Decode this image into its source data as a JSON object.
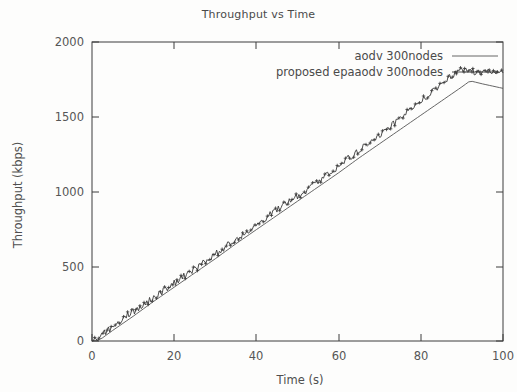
{
  "chart_data": {
    "type": "line",
    "title": "Throughput vs Time",
    "xlabel": "Time (s)",
    "ylabel": "Throughput (kbps)",
    "xlim": [
      0,
      100
    ],
    "ylim": [
      0,
      2000
    ],
    "xticks": [
      "0",
      "20",
      "40",
      "60",
      "80",
      "100"
    ],
    "xtick_values": [
      0,
      20,
      40,
      60,
      80,
      100
    ],
    "yticks": [
      "0",
      "500",
      "1000",
      "1500",
      "2000"
    ],
    "ytick_values": [
      0,
      500,
      1000,
      1500,
      2000
    ],
    "grid": false,
    "legend_position": "top-right-inside",
    "series": [
      {
        "name": "aodv 300nodes",
        "marker": "none",
        "color": "#555555",
        "x": [
          0,
          2,
          5,
          10,
          15,
          20,
          25,
          30,
          35,
          40,
          45,
          50,
          55,
          60,
          65,
          70,
          75,
          80,
          85,
          90,
          92,
          95,
          100
        ],
        "values": [
          0,
          10,
          70,
          165,
          265,
          360,
          455,
          550,
          650,
          745,
          840,
          935,
          1030,
          1125,
          1225,
          1320,
          1415,
          1510,
          1605,
          1700,
          1740,
          1720,
          1690
        ]
      },
      {
        "name": "proposed epaaodv 300nodes",
        "marker": "plus",
        "color": "#3a3a3a",
        "x": [
          0,
          1,
          2,
          3,
          5,
          7,
          9,
          11,
          13,
          15,
          17,
          19,
          21,
          23,
          25,
          27,
          29,
          31,
          33,
          35,
          37,
          39,
          41,
          43,
          45,
          47,
          49,
          51,
          53,
          55,
          57,
          59,
          61,
          63,
          65,
          67,
          69,
          71,
          73,
          75,
          77,
          79,
          81,
          83,
          85,
          87,
          89,
          91,
          93,
          95,
          97,
          100
        ],
        "values": [
          0,
          5,
          25,
          55,
          95,
          140,
          180,
          215,
          255,
          290,
          330,
          370,
          405,
          445,
          480,
          520,
          560,
          600,
          640,
          680,
          715,
          755,
          795,
          840,
          875,
          915,
          950,
          985,
          1025,
          1070,
          1110,
          1150,
          1190,
          1235,
          1275,
          1315,
          1360,
          1400,
          1445,
          1490,
          1535,
          1580,
          1625,
          1670,
          1715,
          1760,
          1805,
          1820,
          1800,
          1795,
          1800,
          1800
        ]
      }
    ]
  }
}
